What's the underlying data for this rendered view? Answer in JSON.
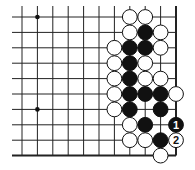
{
  "diagram": {
    "type": "go-board-fragment",
    "columns": 11,
    "rows": 10,
    "x0": 22,
    "y0": 17,
    "spacing": 15.4,
    "edges": {
      "right": true,
      "bottom": true
    },
    "star_points": [
      [
        1,
        0
      ],
      [
        1,
        6
      ]
    ],
    "stones": [
      {
        "c": 7,
        "r": 0,
        "color": "white"
      },
      {
        "c": 8,
        "r": 0,
        "color": "white"
      },
      {
        "c": 7,
        "r": 1,
        "color": "white"
      },
      {
        "c": 8,
        "r": 1,
        "color": "black"
      },
      {
        "c": 9,
        "r": 1,
        "color": "white"
      },
      {
        "c": 6,
        "r": 2,
        "color": "white"
      },
      {
        "c": 7,
        "r": 2,
        "color": "black"
      },
      {
        "c": 8,
        "r": 2,
        "color": "black"
      },
      {
        "c": 9,
        "r": 2,
        "color": "white"
      },
      {
        "c": 6,
        "r": 3,
        "color": "white"
      },
      {
        "c": 7,
        "r": 3,
        "color": "black"
      },
      {
        "c": 8,
        "r": 3,
        "color": "white"
      },
      {
        "c": 6,
        "r": 4,
        "color": "white"
      },
      {
        "c": 7,
        "r": 4,
        "color": "black"
      },
      {
        "c": 8,
        "r": 4,
        "color": "white"
      },
      {
        "c": 9,
        "r": 4,
        "color": "white"
      },
      {
        "c": 6,
        "r": 5,
        "color": "white"
      },
      {
        "c": 7,
        "r": 5,
        "color": "black"
      },
      {
        "c": 8,
        "r": 5,
        "color": "black"
      },
      {
        "c": 9,
        "r": 5,
        "color": "black"
      },
      {
        "c": 10,
        "r": 5,
        "color": "white"
      },
      {
        "c": 6,
        "r": 6,
        "color": "white"
      },
      {
        "c": 7,
        "r": 6,
        "color": "black"
      },
      {
        "c": 9,
        "r": 6,
        "color": "black"
      },
      {
        "c": 7,
        "r": 7,
        "color": "white"
      },
      {
        "c": 8,
        "r": 7,
        "color": "black"
      },
      {
        "c": 10,
        "r": 7,
        "color": "black",
        "label": "1"
      },
      {
        "c": 7,
        "r": 8,
        "color": "white"
      },
      {
        "c": 8,
        "r": 8,
        "color": "white"
      },
      {
        "c": 9,
        "r": 8,
        "color": "black"
      },
      {
        "c": 10,
        "r": 8,
        "color": "white",
        "label": "2"
      },
      {
        "c": 9,
        "r": 9,
        "color": "white"
      }
    ]
  }
}
